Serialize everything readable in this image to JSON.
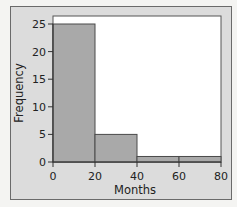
{
  "chart_data": {
    "type": "bar",
    "subtype": "histogram",
    "title": "",
    "xlabel": "Months",
    "ylabel": "Frequency",
    "bins": [
      {
        "start": 0,
        "end": 20,
        "value": 25
      },
      {
        "start": 20,
        "end": 40,
        "value": 5
      },
      {
        "start": 40,
        "end": 60,
        "value": 1
      },
      {
        "start": 60,
        "end": 80,
        "value": 1
      }
    ],
    "categories": [
      "0-20",
      "20-40",
      "40-60",
      "60-80"
    ],
    "values": [
      25,
      5,
      1,
      1
    ],
    "xlim": [
      0,
      80
    ],
    "ylim": [
      0,
      25
    ],
    "xticks": [
      "0",
      "20",
      "40",
      "60",
      "80"
    ],
    "yticks": [
      "0",
      "5",
      "10",
      "15",
      "20",
      "25"
    ],
    "grid": false,
    "legend": null,
    "colors": {
      "bar_fill": "#a9a9a9",
      "bar_edge": "#4a4a4a",
      "plot_bg": "#ffffff",
      "panel_bg": "#dcdcdc"
    }
  }
}
